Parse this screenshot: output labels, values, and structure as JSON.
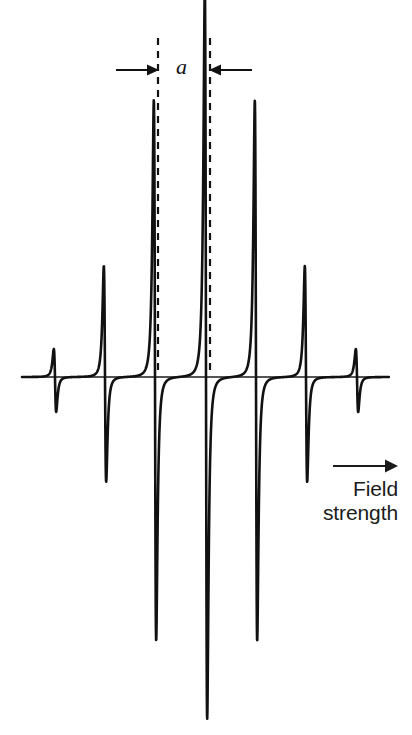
{
  "figure": {
    "kind": "esr-derivative-spectrum",
    "background_color": "#ffffff",
    "trace_color": "#111111",
    "baseline_color": "#1b1b1b"
  },
  "annotations": {
    "coupling_constant_label": "a",
    "axis_arrow_icon": "right-arrow-icon",
    "axis_label_line1": "Field",
    "axis_label_line2": "strength",
    "axis_label_text": "Field strength"
  },
  "chart_data": {
    "type": "line",
    "title": "",
    "xlabel": "Field strength",
    "ylabel": "",
    "grid": false,
    "legend": null,
    "baseline_y_px": 377,
    "x_axis_start_px": 22,
    "x_axis_end_px": 389,
    "n_lines": 7,
    "line_spacing_px": 50,
    "categories": [
      "1",
      "2",
      "3",
      "4",
      "5",
      "6",
      "7"
    ],
    "centers_px": [
      55,
      105,
      155,
      206,
      256,
      306,
      357
    ],
    "relative_intensities": [
      1,
      6,
      15,
      20,
      15,
      6,
      1
    ],
    "peak_top_px": [
      349,
      266,
      100,
      -12,
      100,
      266,
      349
    ],
    "trough_bottom_px": [
      412,
      482,
      641,
      719,
      641,
      482,
      412
    ],
    "peak_amplitude_px": [
      28,
      111,
      277,
      389,
      277,
      111,
      28
    ],
    "trough_amplitude_px": [
      35,
      105,
      264,
      342,
      264,
      105,
      35
    ],
    "values": [
      1,
      6,
      15,
      20,
      15,
      6,
      1
    ],
    "ylim": [
      -390,
      400
    ]
  },
  "marker": {
    "dashed_line_1_x_px": 158,
    "dashed_line_2_x_px": 210,
    "dashed_line_top_px": 38,
    "dashed_line_bottom_px": 374,
    "left_arrow_from_x_px": 116,
    "left_arrow_to_x_px": 156,
    "right_arrow_from_x_px": 252,
    "right_arrow_to_x_px": 212,
    "arrow_y_px": 70,
    "measured_quantity": "a"
  }
}
